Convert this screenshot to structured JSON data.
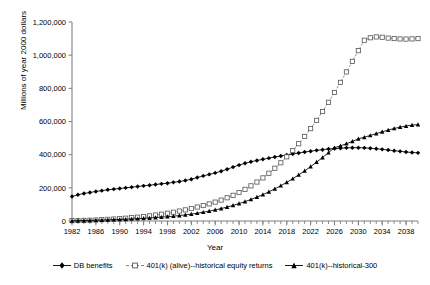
{
  "chart_data": {
    "type": "line",
    "title": "",
    "xlabel": "Year",
    "ylabel": "Millions of year 2000 dollars",
    "xlim": [
      1982,
      2040
    ],
    "ylim": [
      0,
      1200000
    ],
    "ytick_labels": [
      "0",
      "200,000",
      "400,000",
      "600,000",
      "800,000",
      "1,000,000",
      "1,200,000"
    ],
    "ytick_values": [
      0,
      200000,
      400000,
      600000,
      800000,
      1000000,
      1200000
    ],
    "xtick_labels": [
      "1982",
      "1986",
      "1990",
      "1994",
      "1998",
      "2002",
      "2006",
      "2010",
      "2014",
      "2018",
      "2022",
      "2026",
      "2030",
      "2034",
      "2038"
    ],
    "xtick_values": [
      1982,
      1986,
      1990,
      1994,
      1998,
      2002,
      2006,
      2010,
      2014,
      2018,
      2022,
      2026,
      2030,
      2034,
      2038
    ],
    "x_minor_step": 1,
    "grid": false,
    "legend_position": "bottom",
    "x": [
      1982,
      1983,
      1984,
      1985,
      1986,
      1987,
      1988,
      1989,
      1990,
      1991,
      1992,
      1993,
      1994,
      1995,
      1996,
      1997,
      1998,
      1999,
      2000,
      2001,
      2002,
      2003,
      2004,
      2005,
      2006,
      2007,
      2008,
      2009,
      2010,
      2011,
      2012,
      2013,
      2014,
      2015,
      2016,
      2017,
      2018,
      2019,
      2020,
      2021,
      2022,
      2023,
      2024,
      2025,
      2026,
      2027,
      2028,
      2029,
      2030,
      2031,
      2032,
      2033,
      2034,
      2035,
      2036,
      2037,
      2038,
      2039,
      2040
    ],
    "series": [
      {
        "name": "DB benefits",
        "marker": "filled-diamond",
        "color": "#000000",
        "values": [
          148000,
          158000,
          166000,
          172000,
          178000,
          183000,
          188000,
          192000,
          196000,
          200000,
          204000,
          208000,
          212000,
          216000,
          220000,
          224000,
          228000,
          233000,
          238000,
          244000,
          252000,
          262000,
          272000,
          281000,
          290000,
          300000,
          312000,
          325000,
          337000,
          348000,
          357000,
          365000,
          372000,
          379000,
          386000,
          392000,
          398000,
          404000,
          410000,
          416000,
          421000,
          426000,
          430000,
          434000,
          437000,
          439000,
          441000,
          442000,
          442000,
          441000,
          439000,
          436000,
          432000,
          428000,
          424000,
          420000,
          416000,
          413000,
          411000
        ]
      },
      {
        "name": "401(k) (alive)--historical equity returns",
        "marker": "open-square",
        "color": "#808080",
        "values": [
          2000,
          3000,
          4000,
          5000,
          6000,
          8000,
          10000,
          12000,
          14000,
          17000,
          20000,
          23000,
          27000,
          31000,
          36000,
          41000,
          47000,
          53000,
          60000,
          67000,
          75000,
          84000,
          93000,
          103000,
          114000,
          126000,
          140000,
          155000,
          172000,
          191000,
          212000,
          235000,
          260000,
          288000,
          318000,
          351000,
          387000,
          425000,
          466000,
          510000,
          557000,
          607000,
          660000,
          716000,
          775000,
          836000,
          899000,
          963000,
          1027000,
          1090000,
          1105000,
          1110000,
          1108000,
          1103000,
          1100000,
          1098000,
          1097000,
          1098000,
          1100000
        ]
      },
      {
        "name": "401(k)--historical-300",
        "marker": "filled-triangle",
        "color": "#000000",
        "values": [
          1500,
          2200,
          3000,
          3800,
          4700,
          5700,
          6800,
          8000,
          9300,
          10700,
          12300,
          14000,
          16000,
          18000,
          20500,
          23000,
          26000,
          29000,
          33000,
          37000,
          42000,
          47000,
          53000,
          60000,
          67000,
          75000,
          84000,
          94000,
          105000,
          117000,
          130000,
          144000,
          159000,
          176000,
          194000,
          213000,
          233000,
          255000,
          278000,
          302000,
          328000,
          355000,
          383000,
          412000,
          442000,
          453000,
          466000,
          480000,
          495000,
          505000,
          516000,
          527000,
          538000,
          548000,
          558000,
          566000,
          573000,
          578000,
          582000
        ]
      }
    ]
  },
  "legend": {
    "items": [
      {
        "label": "DB benefits"
      },
      {
        "label": "401(k) (alive)--historical equity returns"
      },
      {
        "label": "401(k)--historical-300"
      }
    ]
  }
}
